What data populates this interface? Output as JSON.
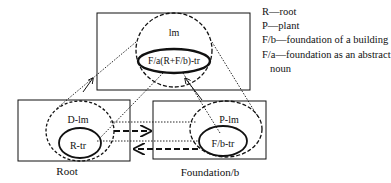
{
  "diagram": {
    "top_box": {
      "ellipse_label": "lm",
      "inner_label": "F/a(R+F/b)-tr"
    },
    "left_box": {
      "title": "Root",
      "ellipse_label": "D-lm",
      "inner_label": "R-tr"
    },
    "right_box": {
      "title": "Foundation/b",
      "ellipse_label": "P-lm",
      "inner_label": "F/b-tr"
    },
    "legend": [
      {
        "key": "R",
        "text": "R—root"
      },
      {
        "key": "P",
        "text": "P—plant"
      },
      {
        "key": "F/b",
        "text": "F/b—foundation of a building"
      },
      {
        "key": "F/a",
        "text": "F/a—foundation as an abstract"
      },
      {
        "key": "F/a-cont",
        "text": "noun"
      }
    ],
    "colors": {
      "stroke": "#111111",
      "background": "#ffffff"
    }
  }
}
